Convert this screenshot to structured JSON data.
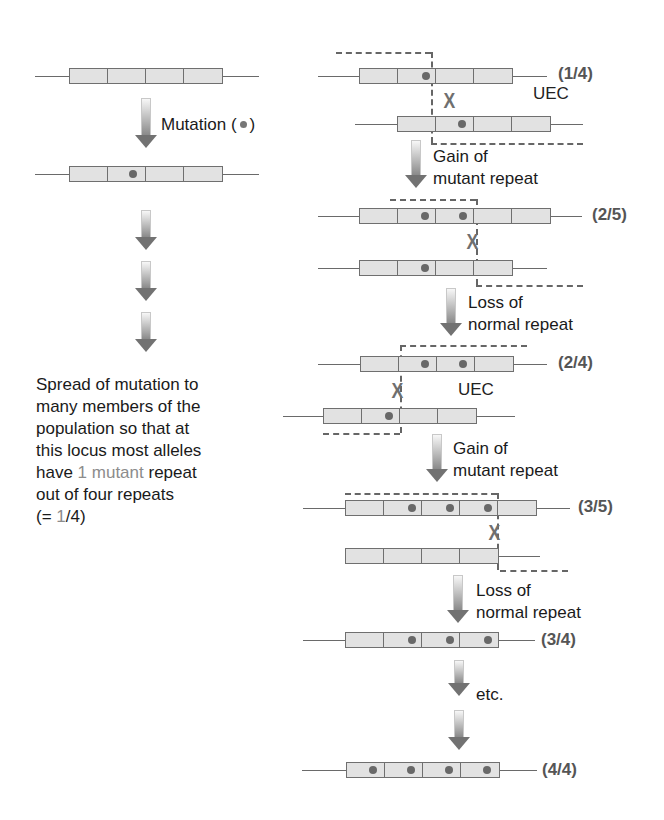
{
  "left": {
    "mutation_label": "Mutation (",
    "mutation_label_end": ")",
    "description": {
      "line1": "Spread of mutation to",
      "line2": "many members of the",
      "line3": "population so that at",
      "line4": "this locus most alleles",
      "line5_pre": "have ",
      "line5_hl": "1 mutant",
      "line5_post": " repeat",
      "line6": "out of four repeats",
      "line7_pre": "(= ",
      "line7_hl": "1",
      "line7_post": "/4)"
    }
  },
  "right": {
    "steps": [
      {
        "ratio": "(1/4)",
        "event": "UEC",
        "transition": [
          "Gain of",
          "mutant repeat"
        ]
      },
      {
        "ratio": "(2/5)",
        "transition": [
          "Loss of",
          "normal repeat"
        ]
      },
      {
        "ratio": "(2/4)",
        "event": "UEC",
        "transition": [
          "Gain of",
          "mutant repeat"
        ]
      },
      {
        "ratio": "(3/5)",
        "transition": [
          "Loss of",
          "normal repeat"
        ]
      },
      {
        "ratio": "(3/4)",
        "transition": [
          "etc."
        ]
      },
      {
        "ratio": "(4/4)"
      }
    ],
    "crossover_symbol": "X"
  },
  "colors": {
    "repeat_fill": "#e2e2e2",
    "repeat_border": "#6f6f6f",
    "mutant_dot": "#686868",
    "dashed_line": "#666666",
    "highlight_text": "#8c8c8c",
    "ratio_text": "#555555"
  }
}
